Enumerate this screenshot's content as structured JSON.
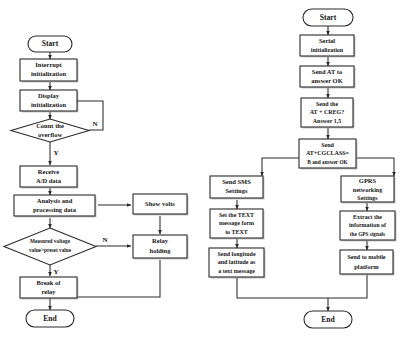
{
  "figure": {
    "type": "flowchart",
    "orientation": "two side-by-side flowcharts",
    "background_color": "#ffffff",
    "line_color": "#2a2a2a",
    "text_color": "#151515"
  },
  "left_flowchart": {
    "name": "measurement-and-relay-control",
    "nodes": [
      {
        "id": "l-start",
        "shape": "terminator",
        "label": "Start"
      },
      {
        "id": "l-interrupt",
        "shape": "process",
        "label_line1": "Interrupt",
        "label_line2": "initialization"
      },
      {
        "id": "l-display",
        "shape": "process",
        "label_line1": "Display",
        "label_line2": "initialization"
      },
      {
        "id": "l-count",
        "shape": "decision",
        "label_line1": "Count the",
        "label_line2": "overflow"
      },
      {
        "id": "l-receive",
        "shape": "process",
        "label_line1": "Receive",
        "label_line2": "A/D data"
      },
      {
        "id": "l-analysis",
        "shape": "process",
        "label_line1": "Analysis and",
        "label_line2": "processing data"
      },
      {
        "id": "l-showvolts",
        "shape": "process",
        "label_line1": "Show volts",
        "label_line2": ""
      },
      {
        "id": "l-measured",
        "shape": "decision",
        "label_line1": "Measured voltage",
        "label_line2": "value>preset value"
      },
      {
        "id": "l-relay",
        "shape": "process",
        "label_line1": "Relay",
        "label_line2": "holding"
      },
      {
        "id": "l-break",
        "shape": "process",
        "label_line1": "Break of",
        "label_line2": "relay"
      },
      {
        "id": "l-end",
        "shape": "terminator",
        "label": "End"
      }
    ],
    "branch_labels": {
      "count_no": "N",
      "count_yes": "Y",
      "measured_no": "N",
      "measured_yes": "Y"
    },
    "edges": [
      {
        "from": "l-start",
        "to": "l-interrupt"
      },
      {
        "from": "l-interrupt",
        "to": "l-display"
      },
      {
        "from": "l-display",
        "to": "l-count"
      },
      {
        "from": "l-count",
        "to": "l-display",
        "label": "N"
      },
      {
        "from": "l-count",
        "to": "l-receive",
        "label": "Y"
      },
      {
        "from": "l-receive",
        "to": "l-analysis"
      },
      {
        "from": "l-analysis",
        "to": "l-showvolts"
      },
      {
        "from": "l-analysis",
        "to": "l-measured"
      },
      {
        "from": "l-showvolts",
        "to": "l-relay"
      },
      {
        "from": "l-measured",
        "to": "l-relay",
        "label": "N"
      },
      {
        "from": "l-measured",
        "to": "l-break",
        "label": "Y"
      },
      {
        "from": "l-relay",
        "to": "l-end"
      },
      {
        "from": "l-break",
        "to": "l-end"
      }
    ]
  },
  "right_flowchart": {
    "name": "gsm-gprs-gps-communication",
    "nodes": [
      {
        "id": "r-start",
        "shape": "terminator",
        "label": "Start"
      },
      {
        "id": "r-serial",
        "shape": "process",
        "label_line1": "Serial",
        "label_line2": "initialization"
      },
      {
        "id": "r-at",
        "shape": "process",
        "label_line1": "Send AT to",
        "label_line2": "answer OK"
      },
      {
        "id": "r-creg",
        "shape": "process",
        "label_line1": "Send the",
        "label_line2": "AT + CREG?",
        "label_line3": "Answer 1,5"
      },
      {
        "id": "r-cgclass",
        "shape": "process",
        "label_line1": "Send",
        "label_line2": "AT+CGCLASS=",
        "label_line3": "B and answer OK"
      },
      {
        "id": "r-sms",
        "shape": "process",
        "label_line1": "Send SMS",
        "label_line2": "Settings"
      },
      {
        "id": "r-gprs",
        "shape": "process",
        "label_line1": "GPRS",
        "label_line2": "networking",
        "label_line3": "Settings"
      },
      {
        "id": "r-text",
        "shape": "process",
        "label_line1": "Set the TEXT",
        "label_line2": "message form",
        "label_line3": "to TEXT"
      },
      {
        "id": "r-extract",
        "shape": "process",
        "label_line1": "Extract the",
        "label_line2": "information of",
        "label_line3": "the GPS signals"
      },
      {
        "id": "r-sendpos",
        "shape": "process",
        "label_line1": "Send longitude",
        "label_line2": "and latitude as",
        "label_line3": "a text message"
      },
      {
        "id": "r-mobile",
        "shape": "process",
        "label_line1": "Send to mobile",
        "label_line2": "platform"
      },
      {
        "id": "r-end",
        "shape": "terminator",
        "label": "End"
      }
    ],
    "edges": [
      {
        "from": "r-start",
        "to": "r-serial"
      },
      {
        "from": "r-serial",
        "to": "r-at"
      },
      {
        "from": "r-at",
        "to": "r-creg"
      },
      {
        "from": "r-creg",
        "to": "r-cgclass"
      },
      {
        "from": "r-cgclass",
        "to": "r-sms"
      },
      {
        "from": "r-cgclass",
        "to": "r-gprs"
      },
      {
        "from": "r-sms",
        "to": "r-text"
      },
      {
        "from": "r-gprs",
        "to": "r-extract"
      },
      {
        "from": "r-text",
        "to": "r-sendpos"
      },
      {
        "from": "r-extract",
        "to": "r-mobile"
      },
      {
        "from": "r-sendpos",
        "to": "r-end"
      },
      {
        "from": "r-mobile",
        "to": "r-end"
      }
    ]
  }
}
